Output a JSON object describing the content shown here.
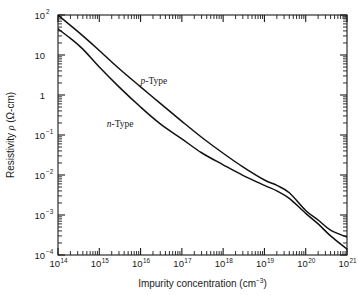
{
  "figure": {
    "background_color": "#ffffff",
    "curve_color": "#111111",
    "axis_color": "#1a1a1a"
  },
  "chart_data": {
    "type": "line",
    "title": "",
    "xlabel": "Impurity concentration (cm",
    "xlabel_sup": "−3",
    "xlabel_tail": ")",
    "ylabel_pre": "Resistivity ",
    "ylabel_rho": "ρ",
    "ylabel_unit": " (Ω-cm)",
    "xscale": "log",
    "yscale": "log",
    "xlim": [
      100000000000000.0,
      1e+21
    ],
    "ylim": [
      0.0001,
      100.0
    ],
    "grid": false,
    "legend_position": "inline-annotations",
    "x_tick_labels": [
      "10¹⁴",
      "10¹⁵",
      "10¹⁶",
      "10¹⁷",
      "10¹⁸",
      "10¹⁹",
      "10²⁰",
      "10²¹"
    ],
    "x_tick_mantissas": [
      "10",
      "10",
      "10",
      "10",
      "10",
      "10",
      "10",
      "10"
    ],
    "x_tick_exponents": [
      "14",
      "15",
      "16",
      "17",
      "18",
      "19",
      "20",
      "21"
    ],
    "y_tick_mantissas": [
      "10",
      "10",
      "1",
      "10",
      "10",
      "10",
      "10"
    ],
    "y_tick_exponents": [
      "2",
      "",
      "",
      "−1",
      "−2",
      "−3",
      "−4"
    ],
    "y_tick_labels": [
      "10²",
      "10",
      "1",
      "10⁻¹",
      "10⁻²",
      "10⁻³",
      "10⁻⁴"
    ],
    "series": [
      {
        "name": "p-Type",
        "label_italic_prefix": "p",
        "label_rest": "-Type",
        "annotation_x": 2.1e+16,
        "annotation_y": 1.9,
        "x": [
          100000000000000.0,
          200000000000000.0,
          400000000000000.0,
          1000000000000000.0,
          3000000000000000.0,
          1e+16,
          3e+16,
          1e+17,
          3e+17,
          1e+18,
          3e+18,
          1e+19,
          2e+19,
          4e+19,
          1e+20,
          2e+20,
          4e+20,
          1e+21
        ],
        "y": [
          100.0,
          55.0,
          30.0,
          13.0,
          4.6,
          1.6,
          0.62,
          0.22,
          0.088,
          0.035,
          0.016,
          0.0075,
          0.0055,
          0.0036,
          0.0013,
          0.00075,
          0.00042,
          0.00028
        ]
      },
      {
        "name": "n-Type",
        "label_italic_prefix": "n",
        "label_rest": "-Type",
        "annotation_x": 3200000000000000.0,
        "annotation_y": 0.16,
        "x": [
          100000000000000.0,
          200000000000000.0,
          400000000000000.0,
          1000000000000000.0,
          3000000000000000.0,
          1e+16,
          3e+16,
          1e+17,
          3e+17,
          1e+18,
          3e+18,
          1e+19,
          2e+19,
          4e+19,
          1e+20,
          2e+20,
          4e+20,
          1e+21
        ],
        "y": [
          45.0,
          26.0,
          14.0,
          5.0,
          1.6,
          0.5,
          0.19,
          0.08,
          0.036,
          0.018,
          0.0098,
          0.0055,
          0.004,
          0.0026,
          0.0011,
          0.0006,
          0.0003,
          0.00014
        ]
      }
    ]
  }
}
